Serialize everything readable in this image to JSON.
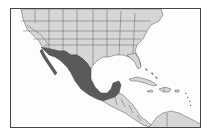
{
  "map": {
    "title": "",
    "region": "North America, Central America and the Caribbean",
    "highlighted_country": "Mexico",
    "colors": {
      "highlight": "#5a5a5a",
      "land": "#d6d6d6",
      "water": "#fdfdfd",
      "border": "#555555",
      "frame": "#444444"
    },
    "visible_regions": [
      "United States",
      "Mexico",
      "Guatemala",
      "Belize",
      "Honduras",
      "El Salvador",
      "Nicaragua",
      "Costa Rica",
      "Panama",
      "Cuba",
      "Haiti",
      "Dominican Republic",
      "Jamaica",
      "Puerto Rico",
      "Bahamas",
      "Lesser Antilles",
      "Colombia",
      "Venezuela"
    ]
  }
}
